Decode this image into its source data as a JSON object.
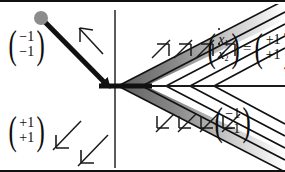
{
  "figure": {
    "background_color": "#ffffff",
    "border_color": "#111111"
  },
  "labels": {
    "upper_left": {
      "name": "vector-minus1-minus1",
      "top": "−1",
      "bottom": "−1"
    },
    "lower_left": {
      "name": "vector-plus1-plus1",
      "top": "+1",
      "bottom": "+1"
    },
    "lower_right": {
      "name": "vector-minus1-minus1",
      "top": "−1",
      "bottom": "−1"
    },
    "equation": {
      "lhs_top": "x",
      "lhs_top_sub": "1",
      "lhs_bottom": "x",
      "lhs_bottom_sub": "2",
      "equals": "=",
      "rhs_top": "+1",
      "rhs_bottom": "+1"
    }
  },
  "axes": {
    "vertical_axis": {
      "name": "vertical-axis",
      "x": 115,
      "y1": 8,
      "y2": 166,
      "color": "#4a4a4a"
    },
    "horizontal_axis": {
      "name": "horizontal-axis",
      "y": 84,
      "x1": 115,
      "x2": 285,
      "color": "#1a1a1a"
    }
  },
  "trajectory": {
    "start_marker": {
      "name": "start-point-marker",
      "cx": 41,
      "cy": 16,
      "r": 7,
      "color": "#8c8c8c"
    },
    "segments": [
      {
        "name": "approach-segment",
        "x1": 41,
        "y1": 16,
        "x2": 108,
        "y2": 84
      },
      {
        "name": "sliding-segment",
        "x1": 100,
        "y1": 84,
        "x2": 152,
        "y2": 84
      }
    ],
    "color": "#111111",
    "width": 5
  },
  "field_arrows": {
    "upper_left": [
      {
        "name": "field-arrow-down-left",
        "x1": 103,
        "y1": 52,
        "x2": 79,
        "y2": 26,
        "direction": "down-left"
      }
    ],
    "lower_left": [
      {
        "name": "field-arrow-up-right",
        "x1": 53,
        "y1": 147,
        "x2": 80,
        "y2": 119,
        "direction": "up-right"
      },
      {
        "name": "field-arrow-up-right",
        "x1": 78,
        "y1": 163,
        "x2": 107,
        "y2": 133,
        "direction": "up-right"
      }
    ],
    "upper_band": [
      {
        "name": "band-arrow-up-right",
        "x1": 160,
        "y1": 54,
        "x2": 176,
        "y2": 38
      },
      {
        "name": "band-arrow-up-right",
        "x1": 180,
        "y1": 54,
        "x2": 196,
        "y2": 38
      },
      {
        "name": "band-arrow-up-right",
        "x1": 200,
        "y1": 54,
        "x2": 216,
        "y2": 38
      },
      {
        "name": "band-arrow-up-right",
        "x1": 220,
        "y1": 54,
        "x2": 236,
        "y2": 38
      }
    ],
    "lower_band": [
      {
        "name": "band-arrow-down-left",
        "x1": 172,
        "y1": 112,
        "x2": 156,
        "y2": 128
      },
      {
        "name": "band-arrow-down-left",
        "x1": 192,
        "y1": 112,
        "x2": 176,
        "y2": 128
      },
      {
        "name": "band-arrow-down-left",
        "x1": 212,
        "y1": 112,
        "x2": 196,
        "y2": 128
      },
      {
        "name": "band-arrow-down-left",
        "x1": 232,
        "y1": 112,
        "x2": 216,
        "y2": 128
      }
    ],
    "color": "#1a1a1a"
  },
  "chevron_region": {
    "name": "shaded-chevron-region",
    "apex_x": 118,
    "apex_y": 84,
    "fill_dark": "#6e6e6e",
    "fill_light": "#ffffff",
    "stroke": "#111111",
    "stripes": [
      {
        "name": "chevron-stripe",
        "offset": 0
      },
      {
        "name": "chevron-stripe",
        "offset": 22
      },
      {
        "name": "chevron-stripe",
        "offset": 44
      },
      {
        "name": "chevron-stripe",
        "offset": 66
      },
      {
        "name": "chevron-stripe",
        "offset": 88
      }
    ]
  }
}
